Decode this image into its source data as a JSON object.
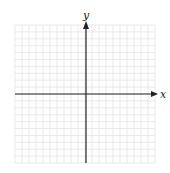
{
  "diagram": {
    "type": "cartesian-coordinate-grid",
    "x_axis_label": "x",
    "y_axis_label": "y",
    "grid": {
      "left": 15,
      "top": 25,
      "right": 155,
      "bottom": 163,
      "cells_x": 20,
      "cells_y": 20
    },
    "origin": {
      "px": 86,
      "py": 94
    },
    "colors": {
      "background": "#ffffff",
      "grid_line": "#e3e3e3",
      "axis": "#222222"
    }
  }
}
